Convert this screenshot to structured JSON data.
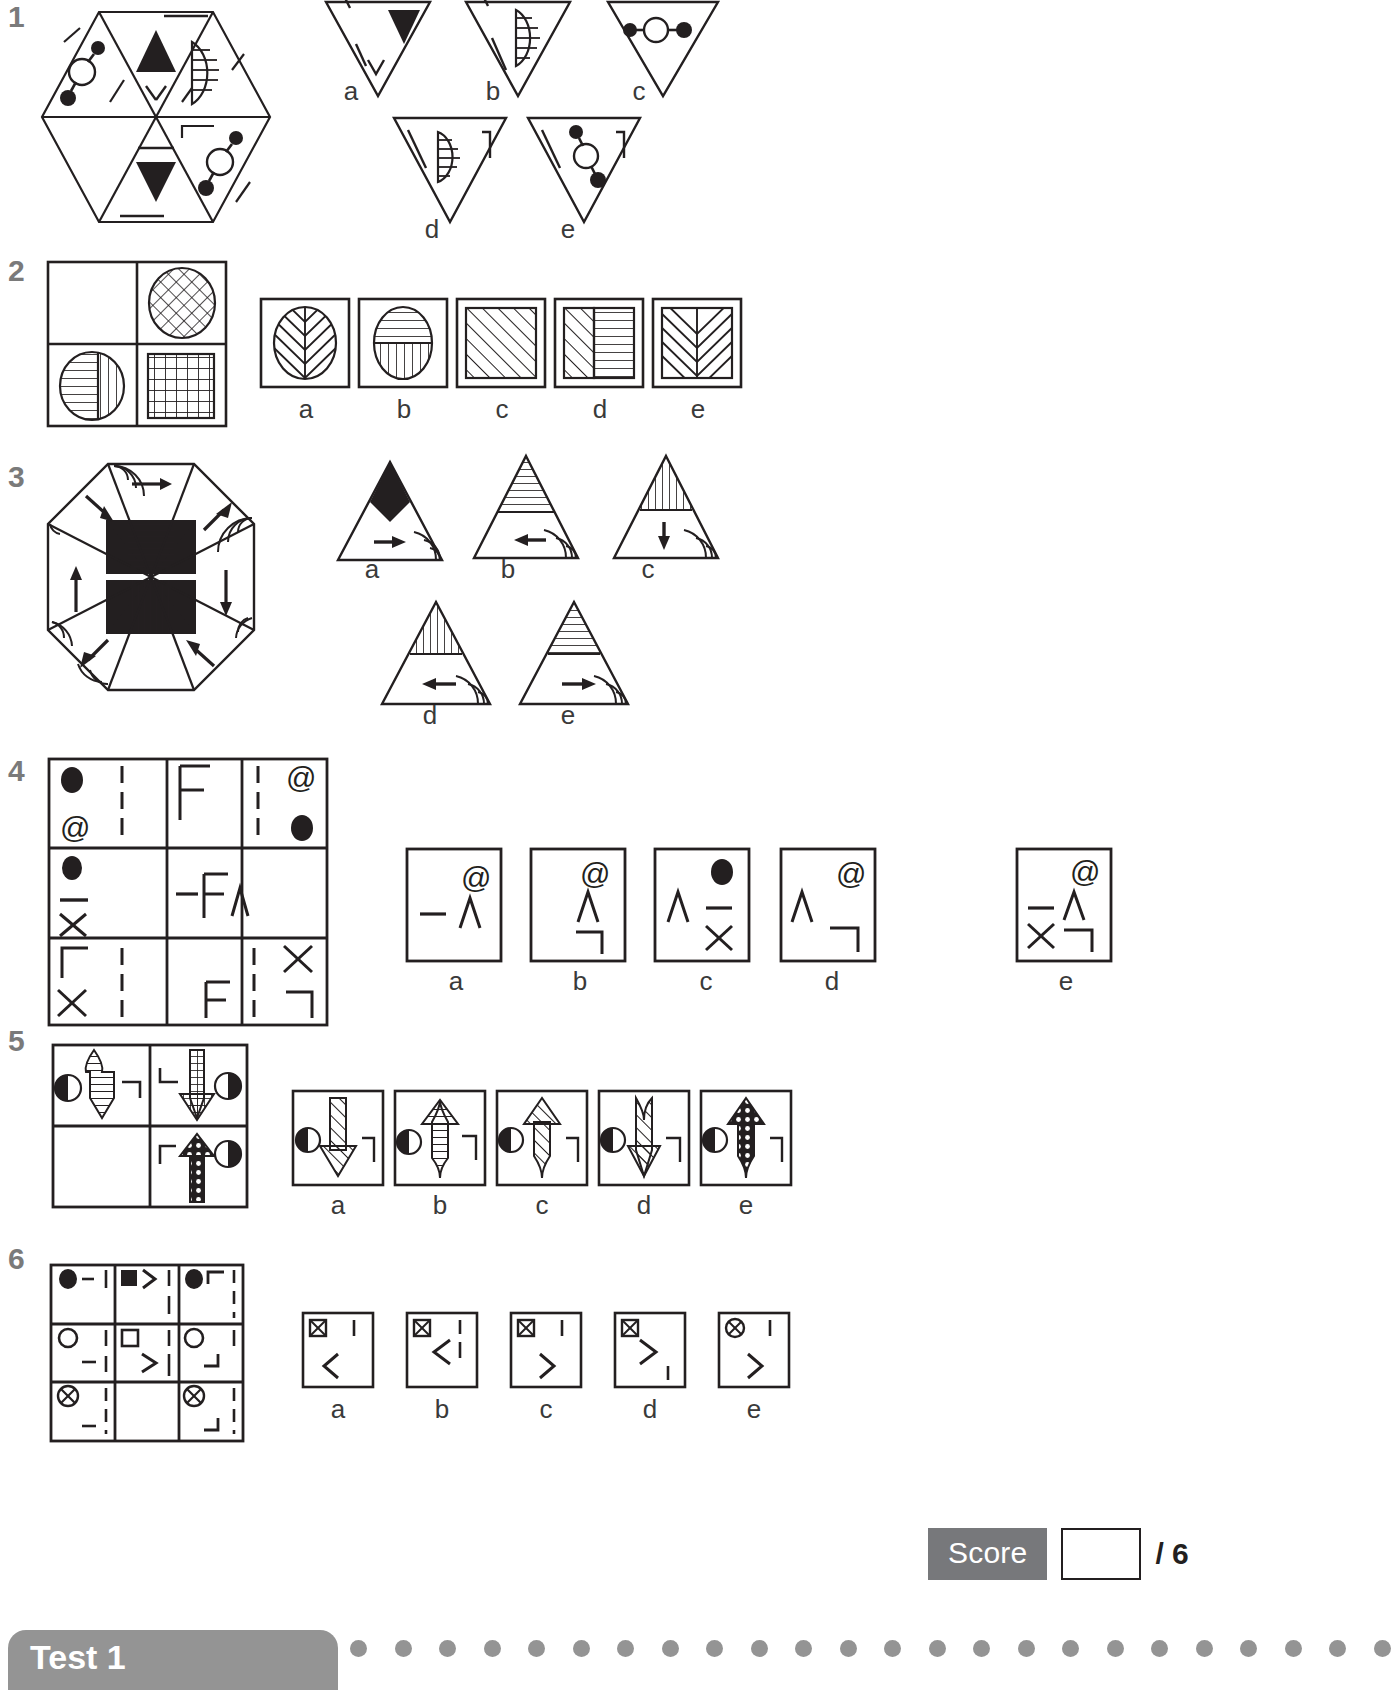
{
  "page": {
    "background_color": "#ffffff",
    "ink_color": "#231f20",
    "muted_color": "#7a7a7a",
    "grey_fill": "#77787b"
  },
  "questions": [
    {
      "number": "1",
      "type": "odd-one-out / complete-the-figure",
      "stem_shape": "hexagon divided into six triangles containing a black up-triangle, a black down-triangle, hatched half-ellipses, dumbbell shapes and short line segments",
      "option_labels": [
        "a",
        "b",
        "c",
        "d",
        "e"
      ],
      "option_shape": "inverted triangle",
      "options": [
        {
          "label": "a",
          "contents": [
            "black down-triangle",
            "corner line",
            "v-line"
          ]
        },
        {
          "label": "b",
          "contents": [
            "hatched half-ellipse",
            "corner line",
            "slash line"
          ]
        },
        {
          "label": "c",
          "contents": [
            "dumbbell (dot-circle-dot)",
            "corner bracket",
            "dash"
          ]
        },
        {
          "label": "d",
          "contents": [
            "hatched half-ellipse",
            "corner bracket",
            "slash line"
          ]
        },
        {
          "label": "e",
          "contents": [
            "dumbbell (dot-circle-dot)",
            "corner bracket",
            "slash line"
          ]
        }
      ]
    },
    {
      "number": "2",
      "type": "matrix 2x2 with missing cell",
      "stem_shape": "2x2 square grid: blank cell, cross-hatched ellipse, half-lined ellipse, fine square grid",
      "option_labels": [
        "a",
        "b",
        "c",
        "d",
        "e"
      ],
      "options": [
        {
          "label": "a",
          "contents": [
            "ellipse with chevron / herringbone hatching"
          ]
        },
        {
          "label": "b",
          "contents": [
            "ellipse, horizontal lines top half, vertical lines bottom half"
          ]
        },
        {
          "label": "c",
          "contents": [
            "square with diagonal hatching"
          ]
        },
        {
          "label": "d",
          "contents": [
            "square, diagonal hatching left, horizontal lines right"
          ]
        },
        {
          "label": "e",
          "contents": [
            "square with herringbone / chevron hatching"
          ]
        }
      ]
    },
    {
      "number": "3",
      "type": "odd-one-out / complete-the-figure",
      "stem_shape": "octagon split into eight sectors with arrows, concentric corner arcs, black bowtie centre with fine stripes",
      "option_labels": [
        "a",
        "b",
        "c",
        "d",
        "e"
      ],
      "option_shape": "upright triangle",
      "options": [
        {
          "label": "a",
          "contents": [
            "solid black diamond apex",
            "right arrow",
            "corner arcs"
          ]
        },
        {
          "label": "b",
          "contents": [
            "horizontally striped apex",
            "left arrow",
            "corner arcs"
          ]
        },
        {
          "label": "c",
          "contents": [
            "vertically striped apex",
            "down arrow",
            "corner arcs"
          ]
        },
        {
          "label": "d",
          "contents": [
            "vertically striped apex",
            "left arrow",
            "corner arcs"
          ]
        },
        {
          "label": "e",
          "contents": [
            "horizontally striped apex",
            "right arrow",
            "corner arcs"
          ]
        }
      ]
    },
    {
      "number": "4",
      "type": "matrix 3x3 with missing cell",
      "stem_description": "3x3 grid of symbol cells; middle-right cell is blank",
      "grid_cells": [
        [
          "black dot, dashed vertical line, @",
          "F",
          "dashed vertical line, @, black dot"
        ],
        [
          "black dot, dash, X",
          "dash F caret",
          ""
        ],
        [
          "bracket, dashed vertical line, X",
          "F",
          "dashed vertical line, X, bracket"
        ]
      ],
      "option_labels": [
        "a",
        "b",
        "c",
        "d",
        "e"
      ],
      "options": [
        {
          "label": "a",
          "contents": [
            "dash",
            "@",
            "caret"
          ]
        },
        {
          "label": "b",
          "contents": [
            "@",
            "caret",
            "bracket"
          ]
        },
        {
          "label": "c",
          "contents": [
            "caret",
            "black dot",
            "dash",
            "X"
          ]
        },
        {
          "label": "d",
          "contents": [
            "caret",
            "@",
            "bracket"
          ]
        },
        {
          "label": "e",
          "contents": [
            "dash",
            "@",
            "caret",
            "X",
            "bracket"
          ]
        }
      ]
    },
    {
      "number": "5",
      "type": "matrix 2x2 with missing cell",
      "stem_description": "2x2 grid of arrows with half-filled circles and corner brackets; bottom-left cell is blank",
      "grid_cells": [
        [
          "down arrow with horizontal stripes, half circle left, corner bracket right",
          "down arrow with cross-hatch fill, corner bracket left, half circle right"
        ],
        [
          "",
          "up arrow with dotted fill, corner bracket left, half circle right"
        ]
      ],
      "option_labels": [
        "a",
        "b",
        "c",
        "d",
        "e"
      ],
      "options": [
        {
          "label": "a",
          "contents": [
            "down arrow, diagonal hatch",
            "half circle left",
            "corner bracket right"
          ]
        },
        {
          "label": "b",
          "contents": [
            "up arrow, horizontal stripes",
            "half circle left",
            "corner bracket right"
          ]
        },
        {
          "label": "c",
          "contents": [
            "up arrow, diagonal hatch",
            "half circle left",
            "corner bracket right"
          ]
        },
        {
          "label": "d",
          "contents": [
            "down arrow, diagonal hatch",
            "half circle left",
            "corner bracket right"
          ]
        },
        {
          "label": "e",
          "contents": [
            "up arrow, dotted fill",
            "half circle left",
            "corner bracket right"
          ]
        }
      ]
    },
    {
      "number": "6",
      "type": "matrix 3x3 with missing cell",
      "stem_description": "3x3 grid of small symbols; bottom-middle cell is blank",
      "grid_cells": [
        [
          "black circle, dash, vertical bar",
          "black square, greater-than, two vertical bars",
          "black circle, corner bracket, dashed vertical bars"
        ],
        [
          "open circle, vertical bar, dash",
          "open square, greater-than, dashed vertical bars",
          "open circle, vertical bar, corner bracket"
        ],
        [
          "crossed circle, dashed vertical bars, dash",
          "",
          "crossed circle, dashed vertical bars, corner bracket"
        ]
      ],
      "option_labels": [
        "a",
        "b",
        "c",
        "d",
        "e"
      ],
      "options": [
        {
          "label": "a",
          "contents": [
            "crossed square",
            "vertical bar",
            "less-than"
          ]
        },
        {
          "label": "b",
          "contents": [
            "crossed square",
            "two vertical bars",
            "less-than"
          ]
        },
        {
          "label": "c",
          "contents": [
            "crossed square",
            "vertical bar",
            "greater-than"
          ]
        },
        {
          "label": "d",
          "contents": [
            "crossed square",
            "greater-than",
            "vertical bar"
          ]
        },
        {
          "label": "e",
          "contents": [
            "crossed circle",
            "vertical bar",
            "greater-than"
          ]
        }
      ]
    }
  ],
  "score": {
    "label": "Score",
    "value": "",
    "total": "/ 6"
  },
  "footer": {
    "tab_label": "Test 1",
    "dot_count": 24
  }
}
